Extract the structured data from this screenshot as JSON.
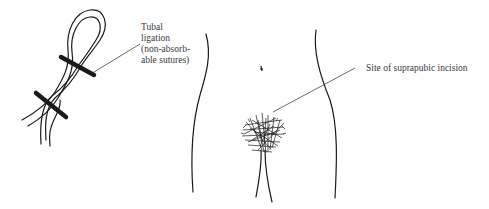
{
  "figure": {
    "labels": {
      "tubal_ligation": {
        "lines": [
          "Tubal",
          "ligation",
          "(non-absorb-",
          "able sutures)"
        ]
      },
      "incision_site": {
        "text": "Site of suprapubic incision"
      }
    },
    "colors": {
      "ink": "#1a1a1a",
      "label_text": "#3a3a3a",
      "background": "#ffffff"
    }
  }
}
